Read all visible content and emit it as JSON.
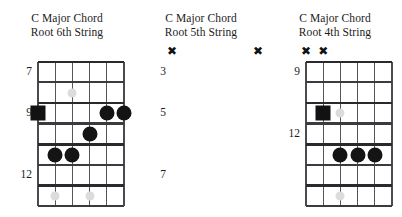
{
  "page": {
    "background_color": "#ffffff",
    "width": 402,
    "height": 217
  },
  "style": {
    "dot_color": "#141414",
    "inlay_color": "#dcdcdc",
    "grid_color": "#2a2a2e",
    "string_color": "#55555a",
    "text_color": "#1c1c1c"
  },
  "diagrams": [
    {
      "id": "root-6th-string",
      "title_line1": "C Major Chord",
      "title_line2": "Root 6th String",
      "fret_labels": [
        "7",
        "9",
        "12"
      ],
      "mutes": [],
      "strings": 6,
      "frets": 7,
      "notes": [
        {
          "type": "root-square",
          "string": 6,
          "fret": 3
        },
        {
          "type": "dot",
          "string": 2,
          "fret": 3
        },
        {
          "type": "dot",
          "string": 1,
          "fret": 3
        },
        {
          "type": "dot",
          "string": 3,
          "fret": 4
        },
        {
          "type": "dot",
          "string": 5,
          "fret": 5
        },
        {
          "type": "dot",
          "string": 4,
          "fret": 5
        }
      ],
      "inlays": [
        {
          "string": 4,
          "fret": 2
        },
        {
          "string": 3,
          "fret": 4
        },
        {
          "string": 5,
          "fret": 7
        },
        {
          "string": 3,
          "fret": 7
        }
      ]
    },
    {
      "id": "root-5th-string",
      "title_line1": "C Major Chord",
      "title_line2": "Root 5th String",
      "fret_labels": [
        "3",
        "5",
        "7"
      ],
      "mutes": [
        {
          "string": 6
        },
        {
          "string": 1
        }
      ],
      "strings": 6,
      "frets": 7,
      "notes": [
        {
          "type": "root-square",
          "string": 5,
          "fret": 3
        },
        {
          "type": "dot",
          "string": 4,
          "fret": 5
        },
        {
          "type": "dot",
          "string": 3,
          "fret": 5
        },
        {
          "type": "dot",
          "string": 2,
          "fret": 5
        }
      ],
      "inlays": [
        {
          "string": 4,
          "fret": 3
        },
        {
          "string": 4,
          "fret": 7
        }
      ]
    },
    {
      "id": "root-4th-string",
      "title_line1": "C Major Chord",
      "title_line2": "Root 4th String",
      "fret_labels": [
        "9",
        "12"
      ],
      "mutes": [
        {
          "string": 6
        },
        {
          "string": 5
        }
      ],
      "strings": 6,
      "frets": 7,
      "notes": [
        {
          "type": "root-square",
          "string": 4,
          "fret": 3
        },
        {
          "type": "dot",
          "string": 3,
          "fret": 5
        },
        {
          "type": "dot",
          "string": 1,
          "fret": 5
        },
        {
          "type": "dot",
          "string": 2,
          "fret": 6
        }
      ],
      "inlays": [
        {
          "string": 3,
          "fret": 2
        },
        {
          "string": 5,
          "fret": 5
        },
        {
          "string": 2,
          "fret": 5
        }
      ]
    }
  ]
}
